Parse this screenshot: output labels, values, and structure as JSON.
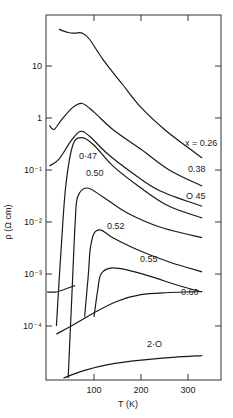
{
  "chart_data": {
    "type": "line",
    "title": "",
    "xlabel": "T (K)",
    "ylabel": "ρ (Ω cm)",
    "xlim": [
      0,
      370
    ],
    "ylim": [
      1e-05,
      95
    ],
    "yscale": "log",
    "grid": false,
    "x_ticks": [
      "100",
      "200",
      "300"
    ],
    "y_ticks": [
      "10",
      "1",
      "10⁻¹",
      "10⁻²",
      "10⁻³",
      "10⁻⁴"
    ],
    "series": [
      {
        "name": "x = 0.26",
        "label": "x = 0.26",
        "points": [
          [
            25,
            51
          ],
          [
            45,
            44
          ],
          [
            60,
            43
          ],
          [
            75,
            43
          ],
          [
            90,
            33
          ],
          [
            120,
            13
          ],
          [
            160,
            4.5
          ],
          [
            200,
            1.6
          ],
          [
            250,
            0.6
          ],
          [
            300,
            0.27
          ],
          [
            330,
            0.17
          ]
        ]
      },
      {
        "name": "0.38",
        "label": "0.38",
        "points": [
          [
            5,
            0.72
          ],
          [
            15,
            0.6
          ],
          [
            30,
            0.9
          ],
          [
            55,
            1.6
          ],
          [
            75,
            1.9
          ],
          [
            100,
            1.3
          ],
          [
            140,
            0.6
          ],
          [
            200,
            0.25
          ],
          [
            260,
            0.1
          ],
          [
            330,
            0.049
          ]
        ]
      },
      {
        "name": "0.45",
        "label": "O 45",
        "points": [
          [
            5,
            0.12
          ],
          [
            25,
            0.16
          ],
          [
            50,
            0.35
          ],
          [
            70,
            0.55
          ],
          [
            90,
            0.45
          ],
          [
            130,
            0.2
          ],
          [
            180,
            0.09
          ],
          [
            240,
            0.04
          ],
          [
            330,
            0.02
          ]
        ]
      },
      {
        "name": "0.47",
        "label": "0·47",
        "points": [
          [
            20,
            0.0001
          ],
          [
            30,
            0.003
          ],
          [
            40,
            0.05
          ],
          [
            55,
            0.3
          ],
          [
            75,
            0.42
          ],
          [
            100,
            0.3
          ],
          [
            140,
            0.12
          ],
          [
            200,
            0.045
          ],
          [
            260,
            0.02
          ],
          [
            330,
            0.012
          ]
        ]
      },
      {
        "name": "0.50",
        "label": "0.50",
        "points": [
          [
            45,
            1e-05
          ],
          [
            50,
            0.0001
          ],
          [
            55,
            0.001
          ],
          [
            60,
            0.01
          ],
          [
            65,
            0.03
          ],
          [
            85,
            0.045
          ],
          [
            120,
            0.03
          ],
          [
            170,
            0.015
          ],
          [
            240,
            0.008
          ],
          [
            330,
            0.005
          ]
        ]
      },
      {
        "name": "0.52",
        "label": "0.52",
        "points": [
          [
            80,
            0.00015
          ],
          [
            88,
            0.001
          ],
          [
            92,
            0.003
          ],
          [
            100,
            0.006
          ],
          [
            115,
            0.007
          ],
          [
            140,
            0.005
          ],
          [
            190,
            0.003
          ],
          [
            260,
            0.0017
          ],
          [
            330,
            0.0011
          ]
        ]
      },
      {
        "name": "0.55",
        "label": "0.55",
        "points": [
          [
            100,
            0.00015
          ],
          [
            108,
            0.0005
          ],
          [
            115,
            0.001
          ],
          [
            135,
            0.0013
          ],
          [
            170,
            0.0012
          ],
          [
            220,
            0.0009
          ],
          [
            280,
            0.0006
          ],
          [
            330,
            0.00045
          ]
        ]
      },
      {
        "name": "0.60",
        "label": "0.60",
        "points": [
          [
            20,
            7e-05
          ],
          [
            60,
            0.00011
          ],
          [
            100,
            0.00018
          ],
          [
            150,
            0.0003
          ],
          [
            200,
            0.0004
          ],
          [
            260,
            0.00044
          ],
          [
            330,
            0.00046
          ]
        ]
      },
      {
        "name": "2.0",
        "label": "2·O",
        "points": [
          [
            35,
            1e-05
          ],
          [
            80,
            1.4e-05
          ],
          [
            130,
            1.8e-05
          ],
          [
            200,
            2.2e-05
          ],
          [
            270,
            2.5e-05
          ],
          [
            330,
            2.7e-05
          ]
        ]
      },
      {
        "name": "low-T segment",
        "label": "",
        "points": [
          [
            0,
            0.00045
          ],
          [
            20,
            0.00045
          ],
          [
            35,
            0.0005
          ],
          [
            60,
            0.0006
          ]
        ]
      }
    ]
  }
}
